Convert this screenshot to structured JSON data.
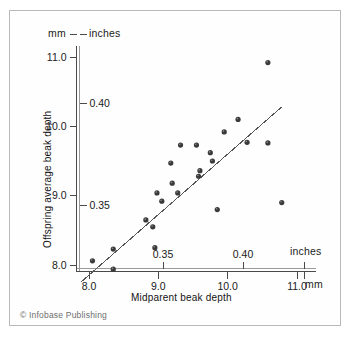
{
  "figure": {
    "credit": "© Infobase Publishing",
    "background_color": "#ffffff",
    "frame_color": "#b9b9b9",
    "point_color": "#3a3a3a",
    "line_color": "#555555"
  },
  "chart_data": {
    "type": "scatter",
    "title": "",
    "xlabel": "Midparent beak depth",
    "ylabel": "Offspring average beak depth",
    "x_unit_primary": "mm",
    "x_unit_secondary": "inches",
    "y_unit_primary": "mm",
    "y_unit_secondary": "inches",
    "xlim": [
      7.8,
      11.25
    ],
    "ylim": [
      7.72,
      11.3
    ],
    "grid": false,
    "legend": null,
    "x_ticks_mm": [
      "8.0",
      "9.0",
      "10.0",
      "11.0"
    ],
    "x_tick_values_mm": [
      8.0,
      9.0,
      10.0,
      11.0
    ],
    "x_ticks_inches": [
      "0.35",
      "0.40"
    ],
    "x_tick_values_inches": [
      0.35,
      0.4
    ],
    "y_ticks_mm": [
      "11.0",
      "10.0",
      "9.0",
      "8.0"
    ],
    "y_tick_values_mm": [
      11.0,
      10.0,
      9.0,
      8.0
    ],
    "y_ticks_inches": [
      "0.40",
      "0.35"
    ],
    "y_tick_values_inches": [
      0.4,
      0.35
    ],
    "unit_label_mm_x": "mm",
    "unit_label_inches_x": "inches",
    "unit_label_mm_y": "mm",
    "unit_label_inches_y": "inches",
    "points": [
      {
        "x": 8.05,
        "y": 8.06
      },
      {
        "x": 8.35,
        "y": 7.94
      },
      {
        "x": 8.35,
        "y": 8.23
      },
      {
        "x": 8.82,
        "y": 8.65
      },
      {
        "x": 8.92,
        "y": 8.55
      },
      {
        "x": 8.95,
        "y": 8.25
      },
      {
        "x": 8.98,
        "y": 9.04
      },
      {
        "x": 9.05,
        "y": 8.92
      },
      {
        "x": 9.18,
        "y": 9.47
      },
      {
        "x": 9.2,
        "y": 9.18
      },
      {
        "x": 9.28,
        "y": 9.04
      },
      {
        "x": 9.32,
        "y": 9.73
      },
      {
        "x": 9.55,
        "y": 9.73
      },
      {
        "x": 9.58,
        "y": 9.28
      },
      {
        "x": 9.6,
        "y": 9.36
      },
      {
        "x": 9.75,
        "y": 9.62
      },
      {
        "x": 9.78,
        "y": 9.5
      },
      {
        "x": 9.85,
        "y": 8.8
      },
      {
        "x": 9.95,
        "y": 9.92
      },
      {
        "x": 10.15,
        "y": 10.1
      },
      {
        "x": 10.28,
        "y": 9.77
      },
      {
        "x": 10.58,
        "y": 10.92
      },
      {
        "x": 10.58,
        "y": 9.76
      },
      {
        "x": 10.78,
        "y": 8.9
      }
    ],
    "regression_line": {
      "x_start": 7.88,
      "y_start": 7.75,
      "x_end": 10.78,
      "y_end": 10.28
    }
  }
}
